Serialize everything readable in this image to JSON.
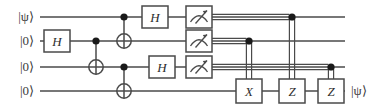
{
  "figure": {
    "kind": "quantum-circuit-diagram",
    "title": "",
    "wire_count": 4,
    "colors": {
      "wire": "#4a4a4a",
      "gate_stroke": "#4a4a4a",
      "gate_fill": "#ffffff",
      "text": "#2e2e2e",
      "label": "#3a3a3a",
      "control_dot": "#1a1a1a",
      "background": "#ffffff"
    },
    "wires": [
      {
        "index": 0,
        "y": 17,
        "input_label": "|ψ⟩",
        "output_label": ""
      },
      {
        "index": 1,
        "y": 41,
        "input_label": "|0⟩",
        "output_label": ""
      },
      {
        "index": 2,
        "y": 67,
        "input_label": "|0⟩",
        "output_label": ""
      },
      {
        "index": 3,
        "y": 91,
        "input_label": "|0⟩",
        "output_label": "|ψ⟩"
      }
    ],
    "wire_x_start": 40,
    "wire_x_end": 345,
    "gates": [
      {
        "id": "h-w1-a",
        "type": "single",
        "label": "H",
        "wire": 1,
        "cx": 57,
        "w": 26,
        "h": 22
      },
      {
        "id": "h-w0-a",
        "type": "single",
        "label": "H",
        "wire": 0,
        "cx": 155,
        "w": 26,
        "h": 22
      },
      {
        "id": "h-w2-a",
        "type": "single",
        "label": "H",
        "wire": 2,
        "cx": 162,
        "w": 26,
        "h": 22
      },
      {
        "id": "x-w3",
        "type": "single",
        "label": "X",
        "wire": 3,
        "cx": 249,
        "w": 26,
        "h": 24
      },
      {
        "id": "z-w3-a",
        "type": "single",
        "label": "Z",
        "wire": 3,
        "cx": 292,
        "w": 26,
        "h": 24
      },
      {
        "id": "z-w3-b",
        "type": "single",
        "label": "Z",
        "wire": 3,
        "cx": 331,
        "w": 26,
        "h": 24
      }
    ],
    "cnots": [
      {
        "id": "cnot-w1-w2",
        "control_wire": 1,
        "target_wire": 2,
        "cx": 96
      },
      {
        "id": "cnot-w0-w1",
        "control_wire": 0,
        "target_wire": 1,
        "cx": 124
      },
      {
        "id": "cnot-w2-w3",
        "control_wire": 2,
        "target_wire": 3,
        "cx": 124
      }
    ],
    "measurements": [
      {
        "id": "meas-w0",
        "wire": 0,
        "cx": 199,
        "w": 26,
        "h": 22
      },
      {
        "id": "meas-w1",
        "wire": 1,
        "cx": 199,
        "w": 26,
        "h": 22
      },
      {
        "id": "meas-w2",
        "wire": 2,
        "cx": 199,
        "w": 26,
        "h": 22
      }
    ],
    "classical_links": [
      {
        "id": "cl-w0-to-z-a",
        "from_wire": 0,
        "to_gate": "z-w3-a",
        "dot_x": 292,
        "gap": 2.6
      },
      {
        "id": "cl-w1-to-x",
        "from_wire": 1,
        "to_gate": "x-w3",
        "dot_x": 249,
        "gap": 2.6
      },
      {
        "id": "cl-w2-to-z-b",
        "from_wire": 2,
        "to_gate": "z-w3-b",
        "dot_x": 331,
        "gap": 2.6
      }
    ]
  }
}
